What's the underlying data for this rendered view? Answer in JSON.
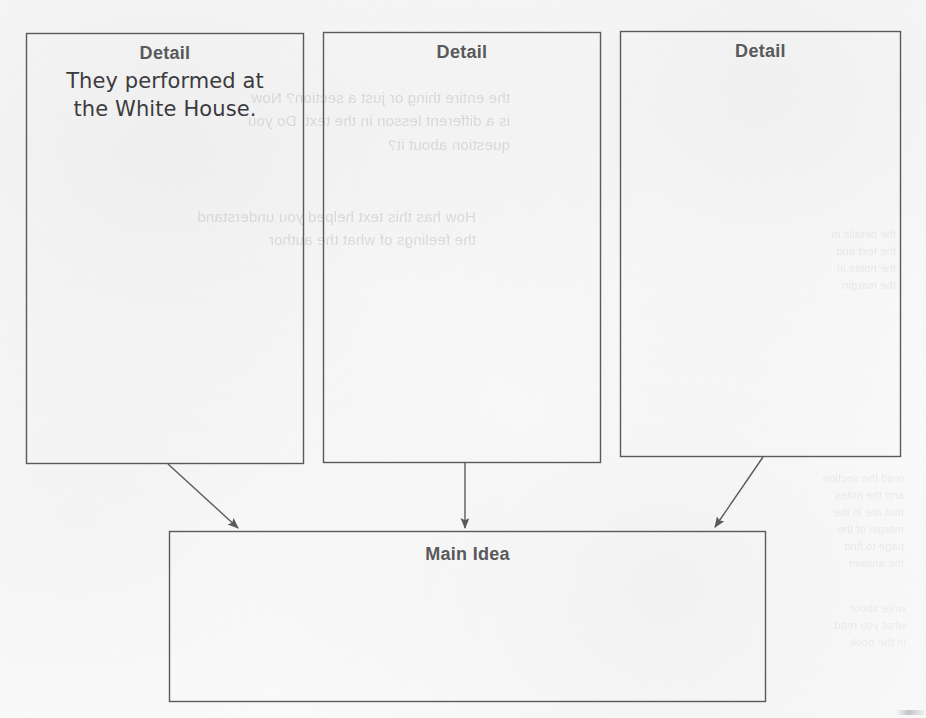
{
  "document": {
    "type": "main-idea-and-details-graphic-organizer",
    "background_color": "#fdfdfd",
    "ink_color": "#5a5a5c",
    "heading_color": "#59595b",
    "handwriting_color": "#3b3b3d",
    "ghost_color": "#c9c9cc"
  },
  "detail_boxes": [
    {
      "heading": "Detail",
      "content": "They performed at\nthe White House.",
      "filled": true
    },
    {
      "heading": "Detail",
      "content": "",
      "filled": false
    },
    {
      "heading": "Detail",
      "content": "",
      "filled": false
    }
  ],
  "main_idea_box": {
    "heading": "Main Idea",
    "content": "",
    "filled": false
  },
  "connectors": [
    {
      "name": "detail-1-to-main-idea",
      "style": "diagonal-right-down"
    },
    {
      "name": "detail-2-to-main-idea",
      "style": "vertical-down"
    },
    {
      "name": "detail-3-to-main-idea",
      "style": "diagonal-left-down"
    }
  ],
  "bleed_through_text": {
    "block_a": "the entire thing or just a section? Now\nis a different lesson in the text. Do you\nquestion about it?",
    "block_b": "How has this text helped you understand\nthe feelings of what the author",
    "block_c": "the details in\nthe text and\nthe notes in\nthe margin",
    "block_d": "read the section\nand the notes\nthat are in the\nmargin of the\npage to find\nthe answer",
    "block_e": "write about\nwhat you read\nin the book"
  }
}
